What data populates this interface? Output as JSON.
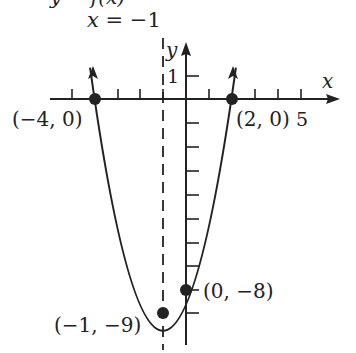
{
  "figure": {
    "top_cut_text": "y = f(x)",
    "axis_line_label": "x = −1",
    "x_axis_label": "x",
    "y_axis_label": "y",
    "y_tick_label": "1",
    "x_tick_label": "5",
    "points": [
      {
        "label": "(−4, 0)",
        "x": -4,
        "y": 0
      },
      {
        "label": "(2, 0)",
        "x": 2,
        "y": 0
      },
      {
        "label": "(0, −8)",
        "x": 0,
        "y": -8
      },
      {
        "label": "(−1, −9)",
        "x": -1,
        "y": -9
      }
    ],
    "function": "y = (x + 4)(x − 2) = x² + 2x − 8",
    "axis_of_symmetry": "x = −1",
    "colors": {
      "ink": "#222222",
      "background": "#ffffff"
    }
  }
}
